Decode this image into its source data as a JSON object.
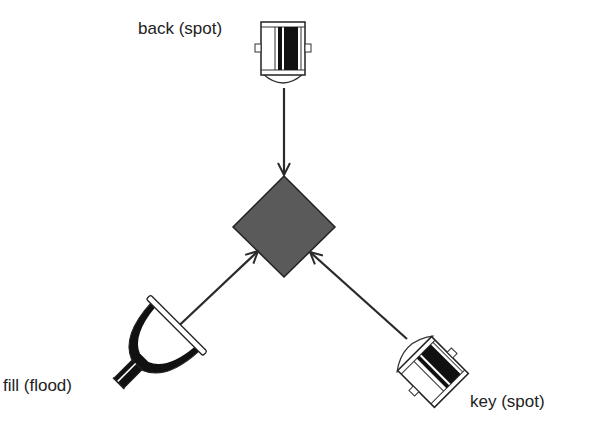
{
  "diagram": {
    "type": "three-point lighting",
    "subject": {
      "shape": "diamond",
      "fill": "#5a5a5a",
      "stroke": "#222222"
    },
    "lights": [
      {
        "id": "back",
        "label": "back (spot)",
        "kind": "spot"
      },
      {
        "id": "fill",
        "label": "fill (flood)",
        "kind": "flood"
      },
      {
        "id": "key",
        "label": "key (spot)",
        "kind": "spot"
      }
    ],
    "arrows": [
      {
        "from": "back",
        "to": "subject"
      },
      {
        "from": "fill",
        "to": "subject"
      },
      {
        "from": "key",
        "to": "subject"
      }
    ],
    "colors": {
      "line": "#2a2a2a",
      "subject": "#5a5a5a",
      "dark": "#111111",
      "background": "#ffffff"
    }
  }
}
